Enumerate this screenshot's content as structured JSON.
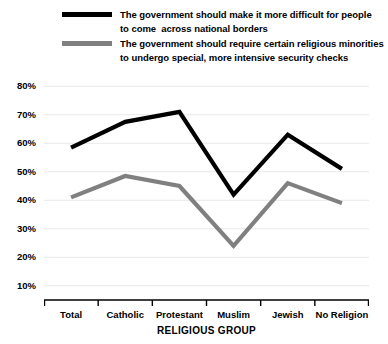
{
  "chart_data": {
    "type": "line",
    "title": "",
    "xlabel": "RELIGIOUS GROUP",
    "ylabel": "",
    "categories": [
      "Total",
      "Catholic",
      "Protestant",
      "Muslim",
      "Jewish",
      "No Religion"
    ],
    "ylim": [
      5,
      85
    ],
    "yticks": [
      10,
      20,
      30,
      40,
      50,
      60,
      70,
      80
    ],
    "ytick_labels": [
      "10%",
      "20%",
      "30%",
      "40%",
      "50%",
      "60%",
      "70%",
      "80%"
    ],
    "grid": true,
    "legend_position": "above-plot",
    "series": [
      {
        "name": "The government should make it more difficult for people to come  across national borders",
        "color": "#000000",
        "values": [
          58.5,
          67.5,
          71,
          42,
          63,
          51
        ]
      },
      {
        "name": "The government should require certain religious minorities to undergo special, more intensive security checks",
        "color": "#808080",
        "values": [
          41,
          48.5,
          45,
          24,
          46,
          39
        ]
      }
    ]
  },
  "legend": {
    "items": [
      {
        "line1": "The government should make it more difficult for people",
        "line2": "to come  across national borders",
        "color": "#000000"
      },
      {
        "line1": "The government should require certain religious minorities",
        "line2": "to undergo special, more intensive security checks",
        "color": "#808080"
      }
    ]
  },
  "axis": {
    "x_title": "RELIGIOUS GROUP",
    "grid_color": "#e8e8e8",
    "axis_color": "#000000"
  }
}
